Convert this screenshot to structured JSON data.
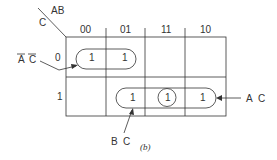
{
  "kmap": {
    "corner": {
      "col_var": "AB",
      "row_var": "C"
    },
    "columns": [
      "00",
      "01",
      "11",
      "10"
    ],
    "rows": [
      "0",
      "1"
    ],
    "cells": {
      "r0": [
        "1",
        "1",
        "",
        ""
      ],
      "r1": [
        "",
        "1",
        "1",
        "1"
      ]
    },
    "groups": [
      {
        "label_a": "A",
        "label_b": "C",
        "overbar": true,
        "cells": "row 0, cols 00-01"
      },
      {
        "label_a": "B",
        "label_b": "C",
        "overbar": false,
        "cells": "row 1, cols 01-11"
      },
      {
        "label_a": "A",
        "label_b": "C",
        "overbar": false,
        "cells": "row 1, cols 11-10"
      }
    ],
    "caption": "(b)"
  },
  "colors": {
    "ink": "#333333",
    "background": "#ffffff"
  }
}
